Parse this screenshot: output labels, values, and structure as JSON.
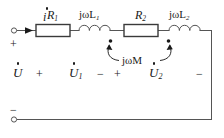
{
  "diagram": {
    "type": "electrical-schematic",
    "stroke_color": "#555555",
    "text_color": "#1a1a1a",
    "background": "#ffffff"
  },
  "labels": {
    "current": "i",
    "resistor1": "R",
    "resistor1_sub": "1",
    "inductor1_pre": "jωL",
    "inductor1_sub": "1",
    "resistor2": "R",
    "resistor2_sub": "2",
    "inductor2_pre": "jωL",
    "inductor2_sub": "2",
    "mutual": "jωM",
    "voltage_source": "U",
    "voltage1": "U",
    "voltage1_sub": "1",
    "voltage2": "U",
    "voltage2_sub": "2"
  },
  "polarity": {
    "source_plus": "+",
    "source_minus": "−",
    "u1_plus": "+",
    "u1_minus": "−",
    "u2_plus": "+",
    "u2_minus": "−"
  },
  "components": [
    {
      "name": "resistor-r1",
      "kind": "resistor",
      "label": "R1"
    },
    {
      "name": "inductor-l1",
      "kind": "inductor",
      "label": "jωL1"
    },
    {
      "name": "resistor-r2",
      "kind": "resistor",
      "label": "R2"
    },
    {
      "name": "inductor-l2",
      "kind": "inductor",
      "label": "jωL2"
    },
    {
      "name": "mutual-coupling",
      "kind": "coupling",
      "label": "jωM"
    }
  ],
  "terminals": {
    "top_label": "+",
    "bottom_label": "−"
  }
}
